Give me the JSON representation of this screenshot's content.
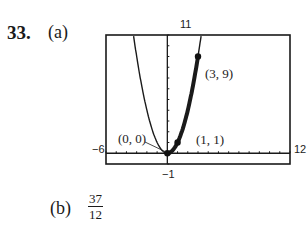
{
  "problem": {
    "number": "33.",
    "part_a_label": "(a)",
    "part_b_label": "(b)",
    "part_b_answer": {
      "numerator": "37",
      "denominator": "12"
    }
  },
  "chart_data": {
    "type": "line",
    "title": "",
    "xlabel": "",
    "ylabel": "",
    "xlim": [
      -6,
      12
    ],
    "ylim": [
      -1,
      11
    ],
    "grid": false,
    "window_labels": {
      "xmin": "−6",
      "xmax": "12",
      "ymin": "−1",
      "ymax": "11"
    },
    "series": [
      {
        "name": "y = x^2",
        "style": "thin",
        "x": [
          -3.3,
          -3,
          -2,
          -1,
          0,
          1,
          2,
          3,
          3.3
        ],
        "y": [
          10.9,
          9,
          4,
          1,
          0,
          1,
          4,
          9,
          10.9
        ]
      },
      {
        "name": "shaded region 0 ≤ x ≤ 3",
        "style": "thick",
        "x": [
          0,
          1,
          2,
          3
        ],
        "y": [
          0,
          1,
          4,
          9
        ]
      }
    ],
    "points": [
      {
        "label": "(0, 0)",
        "x": 0,
        "y": 0
      },
      {
        "label": "(1, 1)",
        "x": 1,
        "y": 1
      },
      {
        "label": "(3, 9)",
        "x": 3,
        "y": 9
      }
    ],
    "x_ticks_count": 17,
    "y_ticks_count": 11
  }
}
